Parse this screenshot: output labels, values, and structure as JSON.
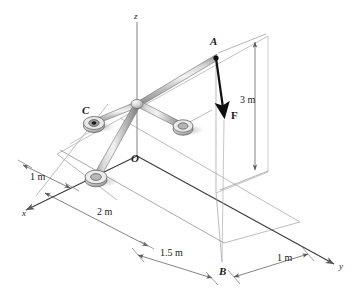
{
  "figure": {
    "background_color": "#ffffff",
    "line_color": "#6b6b6b",
    "dark_line_color": "#1a1a1a",
    "member_fill_light": "#f2f2f2",
    "member_fill_mid": "#b8b8b8",
    "member_fill_dark": "#8a8a8a"
  },
  "axes": [
    {
      "name": "x",
      "label": "x",
      "x": 22,
      "y": 214
    },
    {
      "name": "y",
      "label": "y",
      "x": 340,
      "y": 268
    },
    {
      "name": "z",
      "label": "z",
      "x": 134,
      "y": 13
    }
  ],
  "points": [
    {
      "name": "A",
      "label": "A",
      "x": 216,
      "y": 57,
      "label_x": 210,
      "label_y": 42
    },
    {
      "name": "B",
      "label": "B",
      "x": 222,
      "y": 265,
      "label_x": 219,
      "label_y": 270
    },
    {
      "name": "C",
      "label": "C",
      "x": 93,
      "y": 123,
      "label_x": 82,
      "label_y": 110
    },
    {
      "name": "O",
      "label": "O",
      "x": 137,
      "y": 155,
      "label_x": 131,
      "label_y": 157
    }
  ],
  "force": {
    "name": "F",
    "label": "F",
    "label_x": 232,
    "label_y": 114,
    "tail_x": 216,
    "tail_y": 58,
    "head_x": 224,
    "head_y": 120,
    "direction": "downward"
  },
  "dimensions": [
    {
      "name": "height-A-to-B",
      "label": "3 m",
      "x": 240,
      "y": 100
    },
    {
      "name": "x-offset-support",
      "label": "1 m",
      "x": 30,
      "y": 178
    },
    {
      "name": "x-distance-O",
      "label": "2 m",
      "x": 98,
      "y": 212
    },
    {
      "name": "y-distance-O-to-B",
      "label": "1.5 m",
      "x": 163,
      "y": 252
    },
    {
      "name": "y-offset-beyond-B",
      "label": "1 m",
      "x": 278,
      "y": 258
    }
  ]
}
